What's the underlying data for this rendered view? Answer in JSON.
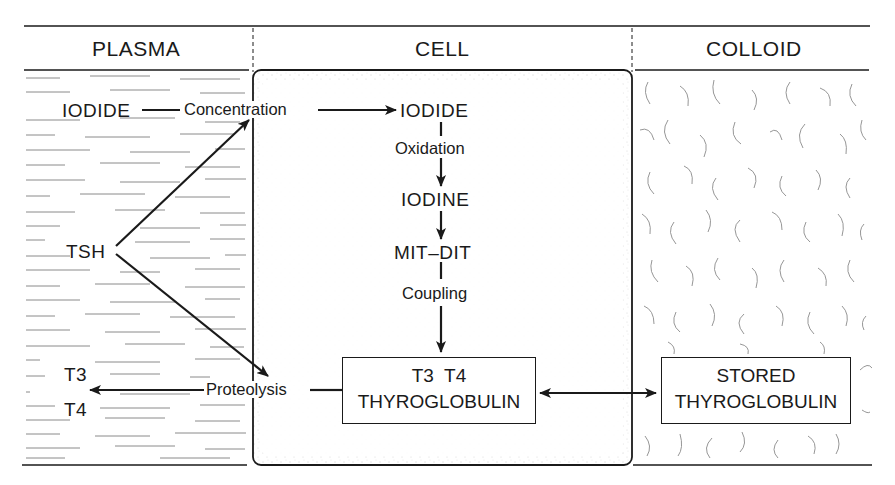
{
  "diagram": {
    "title": "",
    "columns": [
      {
        "id": "plasma",
        "label": "PLASMA"
      },
      {
        "id": "cell",
        "label": "CELL"
      },
      {
        "id": "colloid",
        "label": "COLLOID"
      }
    ],
    "nodes": {
      "plasma_iodide": "IODIDE",
      "tsh": "TSH",
      "t3": "T3",
      "t4": "T4",
      "cell_iodide": "IODIDE",
      "iodine": "IODINE",
      "mit_dit": "MIT–DIT",
      "cell_thyroglobulin_line1": "T3  T4",
      "cell_thyroglobulin_line2": "THYROGLOBULIN",
      "stored_line1": "STORED",
      "stored_line2": "THYROGLOBULIN"
    },
    "processes": {
      "concentration": "Concentration",
      "oxidation": "Oxidation",
      "coupling": "Coupling",
      "proteolysis": "Proteolysis"
    },
    "edges": [
      {
        "from": "IODIDE (plasma)",
        "to": "IODIDE (cell)",
        "label": "Concentration"
      },
      {
        "from": "IODIDE (cell)",
        "to": "IODINE",
        "label": "Oxidation"
      },
      {
        "from": "IODINE",
        "to": "MIT–DIT",
        "label": ""
      },
      {
        "from": "MIT–DIT",
        "to": "T3 T4 THYROGLOBULIN",
        "label": "Coupling"
      },
      {
        "from": "T3 T4 THYROGLOBULIN",
        "to": "T3 / T4 (plasma)",
        "label": "Proteolysis"
      },
      {
        "from": "T3 T4 THYROGLOBULIN",
        "to": "STORED THYROGLOBULIN",
        "label": "",
        "bidirectional": true
      },
      {
        "from": "TSH",
        "to": "Concentration",
        "label": ""
      },
      {
        "from": "TSH",
        "to": "Proteolysis",
        "label": ""
      }
    ],
    "colors": {
      "ink": "#1a1a1a",
      "background": "#ffffff",
      "texture": "#8a8a8a"
    }
  }
}
